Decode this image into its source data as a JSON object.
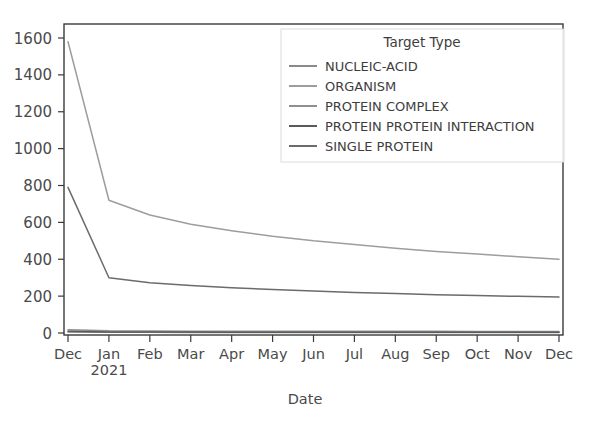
{
  "chart_data": {
    "type": "line",
    "title": "",
    "xlabel": "Date",
    "ylabel": "",
    "categories": [
      "Dec",
      "Jan\n2021",
      "Feb",
      "Mar",
      "Apr",
      "May",
      "Jun",
      "Jul",
      "Aug",
      "Sep",
      "Oct",
      "Nov",
      "Dec"
    ],
    "xtick_labels": [
      "Dec",
      "Jan",
      "Feb",
      "Mar",
      "Apr",
      "May",
      "Jun",
      "Jul",
      "Aug",
      "Sep",
      "Oct",
      "Nov",
      "Dec"
    ],
    "xtick_sublabels": [
      "",
      "2021",
      "",
      "",
      "",
      "",
      "",
      "",
      "",
      "",
      "",
      "",
      ""
    ],
    "ytick_labels": [
      "0",
      "200",
      "400",
      "600",
      "800",
      "1000",
      "1200",
      "1400",
      "1600"
    ],
    "ytick_values": [
      0,
      200,
      400,
      600,
      800,
      1000,
      1200,
      1400,
      1600
    ],
    "ylim": [
      0,
      1700
    ],
    "grid": false,
    "legend_position": "upper right",
    "legend_title": "Target Type",
    "series": [
      {
        "name": "NUCLEIC-ACID",
        "color": "#8a8a8a",
        "values": [
          6,
          4,
          4,
          3,
          3,
          3,
          3,
          3,
          3,
          3,
          3,
          3,
          3
        ]
      },
      {
        "name": "ORGANISM",
        "color": "#9d9d9d",
        "values": [
          1580,
          720,
          640,
          590,
          555,
          525,
          500,
          480,
          460,
          442,
          428,
          414,
          400
        ]
      },
      {
        "name": "PROTEIN COMPLEX",
        "color": "#8f8f8f",
        "values": [
          18,
          12,
          11,
          10,
          10,
          9,
          9,
          9,
          9,
          9,
          8,
          8,
          8
        ]
      },
      {
        "name": "PROTEIN PROTEIN INTERACTION",
        "color": "#5a5a5a",
        "values": [
          10,
          6,
          5,
          5,
          4,
          4,
          4,
          4,
          4,
          4,
          4,
          4,
          4
        ]
      },
      {
        "name": "SINGLE PROTEIN",
        "color": "#6b6b6b",
        "values": [
          790,
          300,
          272,
          258,
          246,
          236,
          228,
          220,
          214,
          208,
          203,
          199,
          195
        ]
      }
    ]
  },
  "axes": {
    "x_title": "Date"
  },
  "legend": {
    "title": "Target Type"
  }
}
